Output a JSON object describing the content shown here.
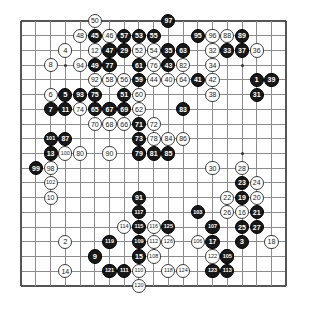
{
  "board": {
    "type": "go-board",
    "size": 19,
    "origin_x": 21.2,
    "origin_y": 21.0,
    "spacing": 14.72,
    "stone_diameter": 14.2,
    "grid_color": "#8c8c8c",
    "edge_color": "#555555",
    "background_color": "#ffffff",
    "black_stone_color": "#181818",
    "white_stone_color": "#ffffff",
    "black_label_color": "#ffffff",
    "white_label_color": "#1a1a1a",
    "star_points": [
      {
        "col": 4,
        "row": 4
      },
      {
        "col": 10,
        "row": 4
      },
      {
        "col": 16,
        "row": 4
      },
      {
        "col": 4,
        "row": 10
      },
      {
        "col": 10,
        "row": 10
      },
      {
        "col": 16,
        "row": 10
      },
      {
        "col": 4,
        "row": 16
      },
      {
        "col": 10,
        "row": 16
      },
      {
        "col": 16,
        "row": 16
      }
    ]
  },
  "moves": [
    {
      "n": 1,
      "color": "black",
      "col": 17,
      "row": 5
    },
    {
      "n": 2,
      "color": "white",
      "col": 4,
      "row": 16
    },
    {
      "n": 3,
      "color": "black",
      "col": 16,
      "row": 16
    },
    {
      "n": 4,
      "color": "white",
      "col": 4,
      "row": 3
    },
    {
      "n": 5,
      "color": "black",
      "col": 4,
      "row": 6
    },
    {
      "n": 6,
      "color": "white",
      "col": 3,
      "row": 6
    },
    {
      "n": 7,
      "color": "black",
      "col": 3,
      "row": 7
    },
    {
      "n": 8,
      "color": "white",
      "col": 3,
      "row": 4
    },
    {
      "n": 9,
      "color": "black",
      "col": 6,
      "row": 17
    },
    {
      "n": 10,
      "color": "white",
      "col": 3,
      "row": 13
    },
    {
      "n": 11,
      "color": "black",
      "col": 4,
      "row": 7
    },
    {
      "n": 12,
      "color": "white",
      "col": 6,
      "row": 3
    },
    {
      "n": 13,
      "color": "black",
      "col": 3,
      "row": 10
    },
    {
      "n": 14,
      "color": "white",
      "col": 4,
      "row": 18
    },
    {
      "n": 15,
      "color": "black",
      "col": 9,
      "row": 17
    },
    {
      "n": 16,
      "color": "white",
      "col": 16,
      "row": 14
    },
    {
      "n": 17,
      "color": "black",
      "col": 14,
      "row": 16
    },
    {
      "n": 18,
      "color": "white",
      "col": 18,
      "row": 16
    },
    {
      "n": 19,
      "color": "black",
      "col": 16,
      "row": 13
    },
    {
      "n": 20,
      "color": "white",
      "col": 17,
      "row": 13
    },
    {
      "n": 21,
      "color": "black",
      "col": 17,
      "row": 14
    },
    {
      "n": 22,
      "color": "white",
      "col": 15,
      "row": 13
    },
    {
      "n": 23,
      "color": "black",
      "col": 16,
      "row": 12
    },
    {
      "n": 24,
      "color": "white",
      "col": 17,
      "row": 12
    },
    {
      "n": 25,
      "color": "black",
      "col": 16,
      "row": 15
    },
    {
      "n": 26,
      "color": "white",
      "col": 15,
      "row": 14
    },
    {
      "n": 27,
      "color": "black",
      "col": 17,
      "row": 15
    },
    {
      "n": 28,
      "color": "white",
      "col": 16,
      "row": 11
    },
    {
      "n": 29,
      "color": "black",
      "col": 8,
      "row": 3
    },
    {
      "n": 30,
      "color": "white",
      "col": 14,
      "row": 11
    },
    {
      "n": 31,
      "color": "black",
      "col": 17,
      "row": 6
    },
    {
      "n": 32,
      "color": "white",
      "col": 14,
      "row": 3
    },
    {
      "n": 33,
      "color": "black",
      "col": 15,
      "row": 3
    },
    {
      "n": 34,
      "color": "white",
      "col": 14,
      "row": 4
    },
    {
      "n": 35,
      "color": "black",
      "col": 11,
      "row": 3
    },
    {
      "n": 36,
      "color": "white",
      "col": 17,
      "row": 3
    },
    {
      "n": 37,
      "color": "black",
      "col": 16,
      "row": 3
    },
    {
      "n": 38,
      "color": "white",
      "col": 14,
      "row": 6
    },
    {
      "n": 39,
      "color": "black",
      "col": 18,
      "row": 5
    },
    {
      "n": 40,
      "color": "white",
      "col": 11,
      "row": 5
    },
    {
      "n": 41,
      "color": "black",
      "col": 13,
      "row": 5
    },
    {
      "n": 42,
      "color": "white",
      "col": 14,
      "row": 5
    },
    {
      "n": 43,
      "color": "black",
      "col": 11,
      "row": 4
    },
    {
      "n": 44,
      "color": "white",
      "col": 10,
      "row": 5
    },
    {
      "n": 45,
      "color": "black",
      "col": 6,
      "row": 2
    },
    {
      "n": 46,
      "color": "white",
      "col": 7,
      "row": 2
    },
    {
      "n": 47,
      "color": "black",
      "col": 7,
      "row": 3
    },
    {
      "n": 48,
      "color": "white",
      "col": 5,
      "row": 2
    },
    {
      "n": 49,
      "color": "black",
      "col": 6,
      "row": 4
    },
    {
      "n": 50,
      "color": "white",
      "col": 6,
      "row": 1
    },
    {
      "n": 51,
      "color": "black",
      "col": 8,
      "row": 6
    },
    {
      "n": 52,
      "color": "white",
      "col": 9,
      "row": 3
    },
    {
      "n": 53,
      "color": "black",
      "col": 9,
      "row": 2
    },
    {
      "n": 54,
      "color": "white",
      "col": 10,
      "row": 3
    },
    {
      "n": 55,
      "color": "black",
      "col": 10,
      "row": 2
    },
    {
      "n": 56,
      "color": "white",
      "col": 8,
      "row": 5
    },
    {
      "n": 57,
      "color": "black",
      "col": 8,
      "row": 2
    },
    {
      "n": 58,
      "color": "white",
      "col": 7,
      "row": 5
    },
    {
      "n": 59,
      "color": "black",
      "col": 9,
      "row": 5
    },
    {
      "n": 60,
      "color": "white",
      "col": 9,
      "row": 6
    },
    {
      "n": 61,
      "color": "black",
      "col": 9,
      "row": 4
    },
    {
      "n": 62,
      "color": "white",
      "col": 9,
      "row": 7
    },
    {
      "n": 63,
      "color": "black",
      "col": 12,
      "row": 3
    },
    {
      "n": 64,
      "color": "white",
      "col": 12,
      "row": 5
    },
    {
      "n": 65,
      "color": "black",
      "col": 6,
      "row": 7
    },
    {
      "n": 66,
      "color": "white",
      "col": 8,
      "row": 8
    },
    {
      "n": 67,
      "color": "black",
      "col": 7,
      "row": 7
    },
    {
      "n": 68,
      "color": "white",
      "col": 7,
      "row": 8
    },
    {
      "n": 69,
      "color": "black",
      "col": 8,
      "row": 7
    },
    {
      "n": 70,
      "color": "white",
      "col": 6,
      "row": 8
    },
    {
      "n": 71,
      "color": "black",
      "col": 9,
      "row": 8
    },
    {
      "n": 72,
      "color": "white",
      "col": 10,
      "row": 8
    },
    {
      "n": 73,
      "color": "black",
      "col": 9,
      "row": 9
    },
    {
      "n": 74,
      "color": "white",
      "col": 5,
      "row": 7
    },
    {
      "n": 75,
      "color": "black",
      "col": 6,
      "row": 6
    },
    {
      "n": 76,
      "color": "white",
      "col": 10,
      "row": 4
    },
    {
      "n": 77,
      "color": "black",
      "col": 7,
      "row": 4
    },
    {
      "n": 78,
      "color": "white",
      "col": 10,
      "row": 9
    },
    {
      "n": 79,
      "color": "black",
      "col": 9,
      "row": 10
    },
    {
      "n": 80,
      "color": "white",
      "col": 5,
      "row": 10
    },
    {
      "n": 81,
      "color": "black",
      "col": 10,
      "row": 10
    },
    {
      "n": 82,
      "color": "white",
      "col": 12,
      "row": 4
    },
    {
      "n": 83,
      "color": "black",
      "col": 12,
      "row": 7
    },
    {
      "n": 84,
      "color": "white",
      "col": 11,
      "row": 9
    },
    {
      "n": 85,
      "color": "black",
      "col": 11,
      "row": 10
    },
    {
      "n": 86,
      "color": "white",
      "col": 12,
      "row": 9
    },
    {
      "n": 87,
      "color": "black",
      "col": 4,
      "row": 9
    },
    {
      "n": 88,
      "color": "white",
      "col": 15,
      "row": 2
    },
    {
      "n": 89,
      "color": "black",
      "col": 16,
      "row": 2
    },
    {
      "n": 90,
      "color": "white",
      "col": 7,
      "row": 10
    },
    {
      "n": 91,
      "color": "black",
      "col": 9,
      "row": 13
    },
    {
      "n": 92,
      "color": "white",
      "col": 6,
      "row": 5
    },
    {
      "n": 93,
      "color": "black",
      "col": 5,
      "row": 6
    },
    {
      "n": 94,
      "color": "white",
      "col": 5,
      "row": 4
    },
    {
      "n": 95,
      "color": "black",
      "col": 13,
      "row": 2
    },
    {
      "n": 96,
      "color": "white",
      "col": 14,
      "row": 2
    },
    {
      "n": 97,
      "color": "black",
      "col": 11,
      "row": 1
    },
    {
      "n": 98,
      "color": "white",
      "col": 3,
      "row": 11
    },
    {
      "n": 99,
      "color": "black",
      "col": 2,
      "row": 11
    },
    {
      "n": 100,
      "color": "white",
      "col": 4,
      "row": 10
    },
    {
      "n": 101,
      "color": "black",
      "col": 3,
      "row": 9
    },
    {
      "n": 102,
      "color": "white",
      "col": 3,
      "row": 12
    },
    {
      "n": 103,
      "color": "black",
      "col": 13,
      "row": 14
    },
    {
      "n": 104,
      "color": "white",
      "col": 15,
      "row": 17
    },
    {
      "n": 105,
      "color": "black",
      "col": 15,
      "row": 17
    },
    {
      "n": 106,
      "color": "white",
      "col": 13,
      "row": 16
    },
    {
      "n": 107,
      "color": "black",
      "col": 14,
      "row": 15
    },
    {
      "n": 108,
      "color": "white",
      "col": 10,
      "row": 17
    },
    {
      "n": 109,
      "color": "black",
      "col": 9,
      "row": 16
    },
    {
      "n": 110,
      "color": "white",
      "col": 9,
      "row": 18
    },
    {
      "n": 111,
      "color": "black",
      "col": 8,
      "row": 18
    },
    {
      "n": 112,
      "color": "white",
      "col": 10,
      "row": 16
    },
    {
      "n": 113,
      "color": "black",
      "col": 15,
      "row": 18
    },
    {
      "n": 114,
      "color": "white",
      "col": 8,
      "row": 15
    },
    {
      "n": 115,
      "color": "black",
      "col": 9,
      "row": 15
    },
    {
      "n": 116,
      "color": "white",
      "col": 10,
      "row": 15
    },
    {
      "n": 117,
      "color": "black",
      "col": 9,
      "row": 14
    },
    {
      "n": 118,
      "color": "white",
      "col": 11,
      "row": 18
    },
    {
      "n": 119,
      "color": "black",
      "col": 7,
      "row": 16
    },
    {
      "n": 120,
      "color": "white",
      "col": 9,
      "row": 19
    },
    {
      "n": 121,
      "color": "black",
      "col": 7,
      "row": 18
    },
    {
      "n": 122,
      "color": "white",
      "col": 14,
      "row": 17
    },
    {
      "n": 123,
      "color": "black",
      "col": 14,
      "row": 18
    },
    {
      "n": 124,
      "color": "white",
      "col": 12,
      "row": 18
    },
    {
      "n": 125,
      "color": "black",
      "col": 11,
      "row": 15
    },
    {
      "n": 126,
      "color": "white",
      "col": 11,
      "row": 16
    }
  ]
}
